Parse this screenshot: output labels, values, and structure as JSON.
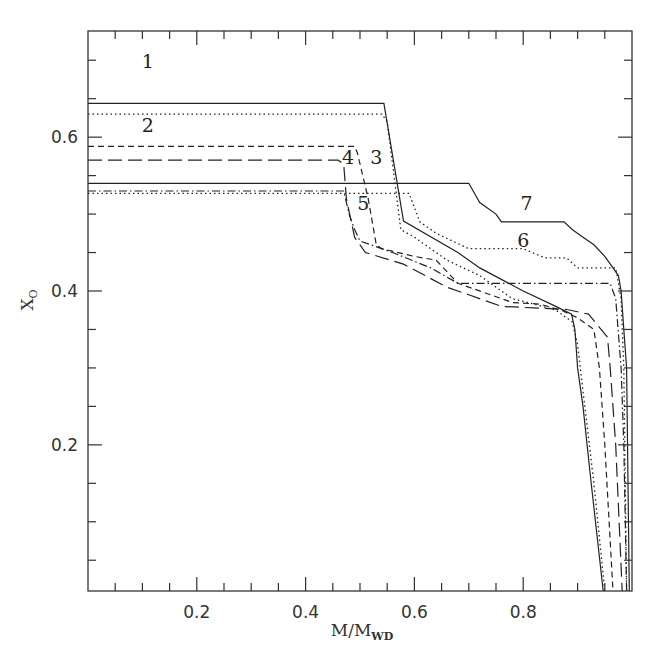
{
  "chart_data": {
    "type": "line",
    "title": "",
    "xlabel": "M/M_WD",
    "xlabel_main": "M/M",
    "xlabel_sub": "WD",
    "ylabel": "X_O",
    "ylabel_main": "X",
    "ylabel_sub": "O",
    "xlim": [
      0,
      1.0
    ],
    "ylim": [
      0.01,
      0.738
    ],
    "grid": false,
    "legend": "inline numeric labels",
    "x_ticks": [
      {
        "value": 0.2,
        "label": "0.2"
      },
      {
        "value": 0.4,
        "label": "0.4"
      },
      {
        "value": 0.6,
        "label": "0.6"
      },
      {
        "value": 0.8,
        "label": "0.8"
      }
    ],
    "x_minor_step": 0.05,
    "y_ticks": [
      {
        "value": 0.2,
        "label": "0.2"
      },
      {
        "value": 0.4,
        "label": "0.4"
      },
      {
        "value": 0.6,
        "label": "0.6"
      }
    ],
    "y_minor_step": 0.05,
    "series": [
      {
        "name": "1",
        "style": "solid",
        "dash": "",
        "label_pos": [
          0.11,
          0.69
        ],
        "points": [
          [
            0,
            0.644
          ],
          [
            0.544,
            0.644
          ],
          [
            0.58,
            0.491
          ],
          [
            0.68,
            0.45
          ],
          [
            0.72,
            0.43
          ],
          [
            0.8,
            0.4
          ],
          [
            0.86,
            0.38
          ],
          [
            0.889,
            0.37
          ],
          [
            0.895,
            0.35
          ],
          [
            0.9,
            0.3
          ],
          [
            0.91,
            0.25
          ],
          [
            0.925,
            0.15
          ],
          [
            0.947,
            0.01
          ]
        ]
      },
      {
        "name": "2",
        "style": "dotted",
        "dash": "1.5 3",
        "label_pos": [
          0.11,
          0.607
        ],
        "points": [
          [
            0,
            0.63
          ],
          [
            0.54,
            0.63
          ],
          [
            0.55,
            0.62
          ],
          [
            0.575,
            0.48
          ],
          [
            0.6,
            0.47
          ],
          [
            0.66,
            0.44
          ],
          [
            0.72,
            0.42
          ],
          [
            0.78,
            0.39
          ],
          [
            0.82,
            0.383
          ],
          [
            0.86,
            0.375
          ],
          [
            0.89,
            0.36
          ],
          [
            0.9,
            0.33
          ],
          [
            0.91,
            0.27
          ],
          [
            0.93,
            0.15
          ],
          [
            0.95,
            0.01
          ]
        ]
      },
      {
        "name": "3",
        "style": "short-dash",
        "dash": "6 4",
        "label_pos": [
          0.53,
          0.565
        ],
        "points": [
          [
            0,
            0.588
          ],
          [
            0.49,
            0.588
          ],
          [
            0.495,
            0.58
          ],
          [
            0.515,
            0.52
          ],
          [
            0.53,
            0.46
          ],
          [
            0.54,
            0.455
          ],
          [
            0.6,
            0.445
          ],
          [
            0.64,
            0.44
          ],
          [
            0.68,
            0.41
          ],
          [
            0.74,
            0.395
          ],
          [
            0.78,
            0.385
          ],
          [
            0.83,
            0.383
          ],
          [
            0.87,
            0.375
          ],
          [
            0.9,
            0.365
          ],
          [
            0.93,
            0.35
          ],
          [
            0.94,
            0.3
          ],
          [
            0.95,
            0.2
          ],
          [
            0.965,
            0.01
          ]
        ]
      },
      {
        "name": "4",
        "style": "long-dash",
        "dash": "14 6",
        "label_pos": [
          0.478,
          0.565
        ],
        "points": [
          [
            0,
            0.57
          ],
          [
            0.46,
            0.57
          ],
          [
            0.47,
            0.565
          ],
          [
            0.475,
            0.52
          ],
          [
            0.49,
            0.47
          ],
          [
            0.51,
            0.45
          ],
          [
            0.58,
            0.435
          ],
          [
            0.66,
            0.405
          ],
          [
            0.7,
            0.395
          ],
          [
            0.76,
            0.38
          ],
          [
            0.82,
            0.378
          ],
          [
            0.88,
            0.376
          ],
          [
            0.92,
            0.37
          ],
          [
            0.955,
            0.34
          ],
          [
            0.96,
            0.3
          ],
          [
            0.97,
            0.2
          ],
          [
            0.982,
            0.01
          ]
        ]
      },
      {
        "name": "5",
        "style": "dash-dot",
        "dash": "8 3 1.5 3",
        "label_pos": [
          0.506,
          0.505
        ],
        "points": [
          [
            0,
            0.53
          ],
          [
            0.47,
            0.53
          ],
          [
            0.48,
            0.5
          ],
          [
            0.49,
            0.48
          ],
          [
            0.5,
            0.465
          ],
          [
            0.56,
            0.45
          ],
          [
            0.63,
            0.43
          ],
          [
            0.68,
            0.41
          ],
          [
            0.96,
            0.41
          ],
          [
            0.97,
            0.39
          ],
          [
            0.98,
            0.3
          ],
          [
            0.985,
            0.2
          ],
          [
            0.99,
            0.01
          ]
        ]
      },
      {
        "name": "6",
        "style": "dotted",
        "dash": "1.5 3",
        "label_pos": [
          0.8,
          0.457
        ],
        "points": [
          [
            0,
            0.527
          ],
          [
            0.59,
            0.527
          ],
          [
            0.61,
            0.49
          ],
          [
            0.64,
            0.475
          ],
          [
            0.7,
            0.455
          ],
          [
            0.8,
            0.455
          ],
          [
            0.84,
            0.443
          ],
          [
            0.88,
            0.443
          ],
          [
            0.9,
            0.43
          ],
          [
            0.97,
            0.43
          ],
          [
            0.98,
            0.39
          ],
          [
            0.985,
            0.3
          ],
          [
            0.99,
            0.01
          ]
        ]
      },
      {
        "name": "7",
        "style": "solid",
        "dash": "",
        "label_pos": [
          0.806,
          0.505
        ],
        "points": [
          [
            0,
            0.54
          ],
          [
            0.7,
            0.54
          ],
          [
            0.72,
            0.515
          ],
          [
            0.75,
            0.5
          ],
          [
            0.76,
            0.49
          ],
          [
            0.875,
            0.49
          ],
          [
            0.89,
            0.48
          ],
          [
            0.91,
            0.47
          ],
          [
            0.93,
            0.46
          ],
          [
            0.95,
            0.445
          ],
          [
            0.965,
            0.43
          ],
          [
            0.975,
            0.42
          ],
          [
            0.98,
            0.4
          ],
          [
            0.985,
            0.35
          ],
          [
            0.99,
            0.3
          ],
          [
            0.995,
            0.01
          ]
        ]
      }
    ]
  },
  "colors": {
    "line": "#222222",
    "frame": "#333333",
    "background": "#ffffff"
  }
}
